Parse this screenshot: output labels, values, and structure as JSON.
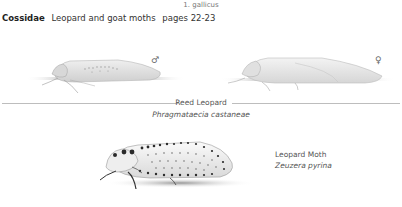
{
  "page": {
    "top_caption": "1. gallicus",
    "heading": {
      "family": "Cossidae",
      "description": "Leopard and goat moths",
      "pages": "pages 22-23"
    }
  },
  "plates": [
    {
      "common_name": "Reed Leopard",
      "latin_name": "Phragmataecia castaneae",
      "figures": [
        {
          "sex_symbol": "♂",
          "sex": "male"
        },
        {
          "sex_symbol": "♀",
          "sex": "female"
        }
      ]
    },
    {
      "common_name": "Leopard Moth",
      "latin_name": "Zeuzera pyrina"
    }
  ],
  "colors": {
    "text": "#333333",
    "muted_text": "#777777",
    "divider": "#bdbdbd",
    "moth_pale": "#e6e6e6",
    "moth_spots": "#2a2a2a"
  }
}
